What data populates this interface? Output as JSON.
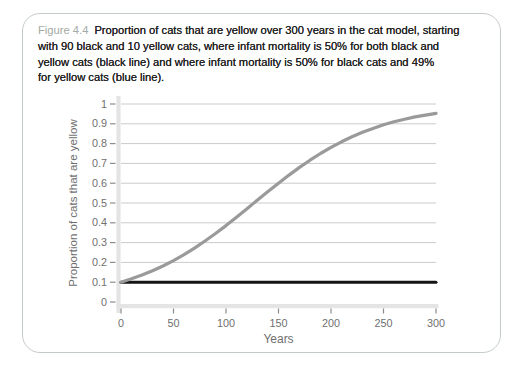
{
  "caption": {
    "label": "Figure 4.4",
    "lines": [
      "Proportion of cats that are yellow over 300 years in the cat model, starting",
      "with 90 black and 10 yellow cats, where infant mortality is 50% for both black and",
      "yellow cats (black line) and where infant mortality is 50% for black cats and 49%",
      "for yellow cats (blue line)."
    ]
  },
  "chart_data": {
    "type": "line",
    "title": "",
    "xlabel": "Years",
    "ylabel": "Proportion of cats that are yellow",
    "xlim": [
      0,
      300
    ],
    "ylim": [
      0,
      1
    ],
    "xticks": [
      "0",
      "50",
      "100",
      "150",
      "200",
      "250",
      "300"
    ],
    "yticks": [
      "0",
      "0.1",
      "0.2",
      "0.3",
      "0.4",
      "0.5",
      "0.6",
      "0.7",
      "0.8",
      "0.9",
      "1"
    ],
    "grid": "horizontal",
    "legend": "none",
    "x": [
      0,
      10,
      20,
      30,
      40,
      50,
      60,
      70,
      80,
      90,
      100,
      110,
      120,
      130,
      140,
      150,
      160,
      170,
      180,
      190,
      200,
      210,
      220,
      230,
      240,
      250,
      260,
      270,
      280,
      290,
      300
    ],
    "series": [
      {
        "name": "infant mortality 50% for both black and yellow cats (black line)",
        "color": "#141414",
        "width": 3,
        "values": [
          0.1,
          0.1,
          0.1,
          0.1,
          0.1,
          0.1,
          0.1,
          0.1,
          0.1,
          0.1,
          0.1,
          0.1,
          0.1,
          0.1,
          0.1,
          0.1,
          0.1,
          0.1,
          0.1,
          0.1,
          0.1,
          0.1,
          0.1,
          0.1,
          0.1,
          0.1,
          0.1,
          0.1,
          0.1,
          0.1,
          0.1
        ]
      },
      {
        "name": "infant mortality 50% for black cats and 49% for yellow cats (blue line, printed gray)",
        "color": "#9a9a9a",
        "width": 3.2,
        "values": [
          0.1,
          0.117,
          0.136,
          0.158,
          0.182,
          0.209,
          0.239,
          0.272,
          0.308,
          0.346,
          0.386,
          0.428,
          0.471,
          0.515,
          0.558,
          0.6,
          0.641,
          0.68,
          0.716,
          0.75,
          0.781,
          0.809,
          0.835,
          0.857,
          0.877,
          0.895,
          0.91,
          0.923,
          0.935,
          0.944,
          0.953
        ]
      }
    ]
  },
  "colors": {
    "box_border": "#c5ccc6",
    "figure_label": "#a3aaa5",
    "caption_text": "#232323",
    "axis_text": "#6f6f6f",
    "grid": "#cbcbcb",
    "axis_band": "#e4e4e4",
    "tick": "#8c8c8c"
  }
}
